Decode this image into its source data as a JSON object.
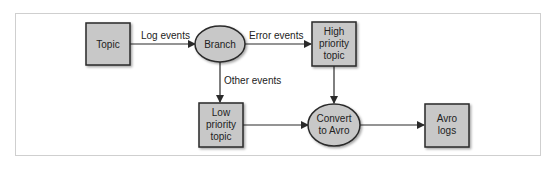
{
  "diagram": {
    "type": "flowchart",
    "colors": {
      "node_fill": "#c8c8c8",
      "node_stroke": "#2a2a2a",
      "edge": "#2a2a2a",
      "frame": "#cfcfcf"
    },
    "nodes": {
      "topic": {
        "shape": "rect",
        "lines": [
          "Topic"
        ]
      },
      "branch": {
        "shape": "ellipse",
        "lines": [
          "Branch"
        ]
      },
      "high": {
        "shape": "rect",
        "lines": [
          "High",
          "priority",
          "topic"
        ]
      },
      "low": {
        "shape": "rect",
        "lines": [
          "Low",
          "priority",
          "topic"
        ]
      },
      "convert": {
        "shape": "ellipse",
        "lines": [
          "Convert",
          "to Avro"
        ]
      },
      "avro": {
        "shape": "rect",
        "lines": [
          "Avro",
          "logs"
        ]
      }
    },
    "edges": {
      "topic_branch": {
        "from": "Topic",
        "to": "Branch",
        "label": "Log events"
      },
      "branch_high": {
        "from": "Branch",
        "to": "High priority topic",
        "label": "Error events"
      },
      "branch_low": {
        "from": "Branch",
        "to": "Low priority topic",
        "label": "Other events"
      },
      "high_convert": {
        "from": "High priority topic",
        "to": "Convert to Avro",
        "label": ""
      },
      "low_convert": {
        "from": "Low priority topic",
        "to": "Convert to Avro",
        "label": ""
      },
      "convert_avro": {
        "from": "Convert to Avro",
        "to": "Avro logs",
        "label": ""
      }
    }
  }
}
